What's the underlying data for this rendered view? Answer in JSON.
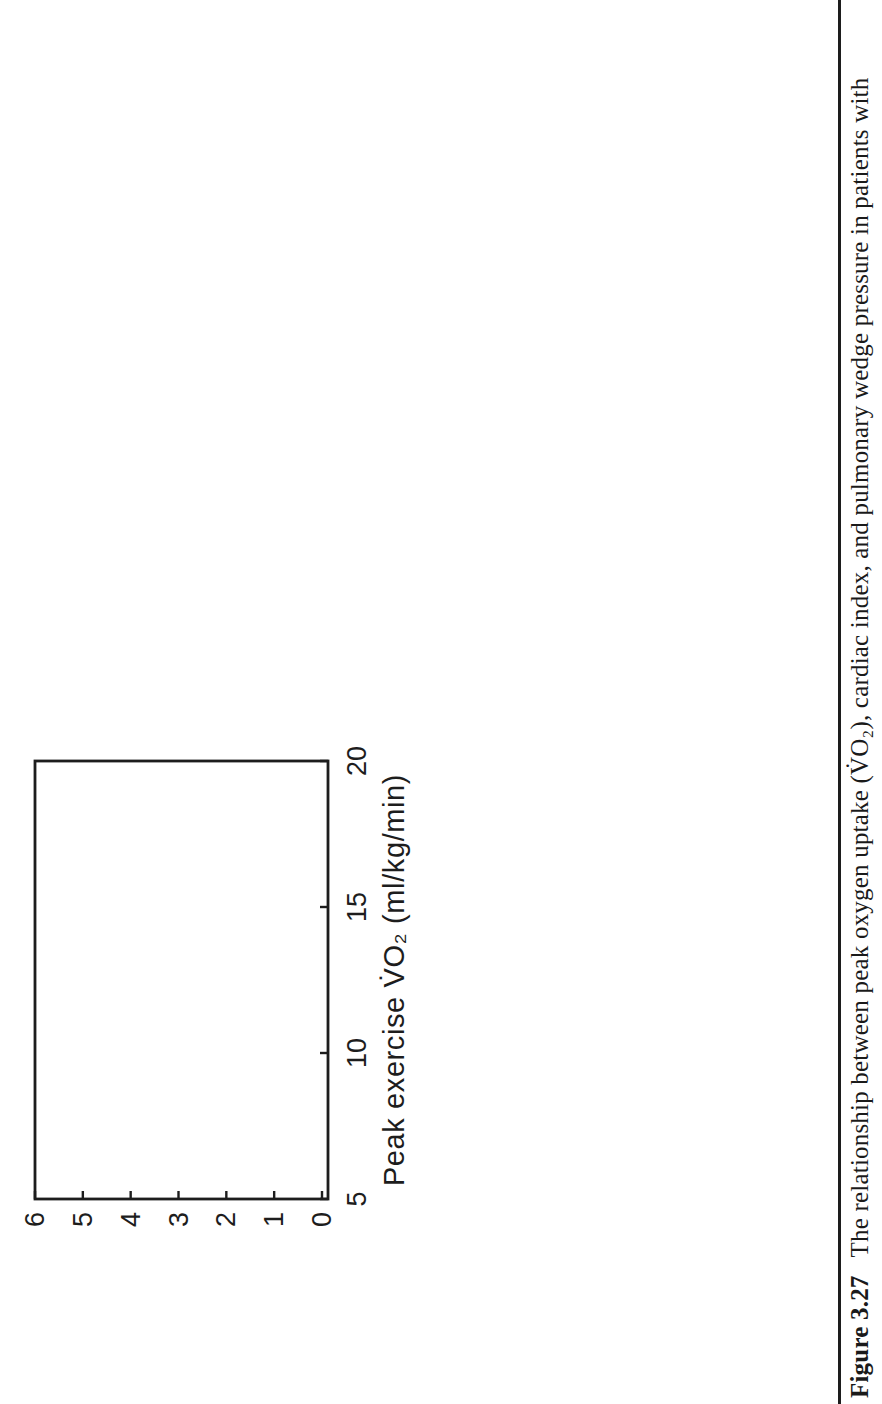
{
  "figure": {
    "caption_label": "Figure 3.27",
    "caption_text": "The relationship between peak oxygen uptake (V̇O₂), cardiac index, and pulmonary wedge pressure in patients with",
    "ink_color": "#1d1d1d",
    "paper_color": "#ffffff"
  },
  "chart_data": [
    {
      "id": "ci3",
      "type": "scatter",
      "position": "top-left",
      "xlabel": "Peak exercise V̇O₂ (ml/kg/min)",
      "ylabel_lines": [
        "Cardiac index at 3 min (L/min/m²)"
      ],
      "xlim": [
        5,
        20
      ],
      "ylim": [
        0,
        6
      ],
      "xticks": [
        5,
        10,
        15,
        20
      ],
      "yticks": [
        0,
        1,
        2,
        3,
        4,
        5,
        6
      ],
      "annotation": "p=NS",
      "points": [
        [
          19.8,
          3.4
        ],
        [
          17.9,
          5.3
        ],
        [
          18.0,
          3.3
        ],
        [
          18.1,
          2.8
        ],
        [
          17.7,
          3.7
        ],
        [
          17.5,
          4.0
        ],
        [
          17.4,
          3.9
        ],
        [
          17.2,
          3.95
        ],
        [
          17.1,
          3.85
        ],
        [
          17.2,
          3.4
        ],
        [
          17.1,
          3.2
        ],
        [
          17.0,
          3.1
        ],
        [
          16.9,
          3.0
        ],
        [
          16.6,
          4.75
        ],
        [
          16.8,
          1.9
        ],
        [
          16.4,
          2.9
        ],
        [
          15.9,
          3.0
        ],
        [
          15.8,
          3.6
        ],
        [
          15.9,
          3.5
        ],
        [
          15.5,
          3.7
        ],
        [
          15.5,
          3.55
        ],
        [
          15.5,
          3.4
        ],
        [
          15.4,
          3.3
        ],
        [
          15.0,
          3.2
        ],
        [
          14.7,
          3.3
        ],
        [
          14.5,
          3.2
        ],
        [
          14.3,
          3.25
        ],
        [
          14.6,
          3.9
        ],
        [
          14.2,
          4.7
        ],
        [
          15.2,
          2.3
        ],
        [
          14.9,
          2.7
        ],
        [
          14.5,
          2.4
        ],
        [
          14.7,
          2.2
        ],
        [
          14.2,
          2.6
        ],
        [
          14.1,
          2.1
        ],
        [
          13.4,
          4.0
        ],
        [
          13.5,
          3.2
        ],
        [
          13.6,
          3.1
        ],
        [
          13.2,
          3.0
        ],
        [
          13.3,
          2.8
        ],
        [
          13.0,
          2.7
        ],
        [
          13.3,
          2.65
        ],
        [
          12.9,
          5.6
        ],
        [
          12.9,
          1.9
        ],
        [
          12.6,
          2.9
        ],
        [
          12.7,
          2.8
        ],
        [
          12.7,
          2.2
        ],
        [
          12.5,
          2.2
        ],
        [
          12.2,
          2.1
        ],
        [
          12.1,
          4.7
        ],
        [
          12.1,
          4.5
        ],
        [
          11.8,
          4.7
        ],
        [
          11.8,
          4.5
        ],
        [
          12.1,
          3.4
        ],
        [
          12.3,
          3.2
        ],
        [
          12.2,
          3.1
        ],
        [
          12.1,
          2.6
        ],
        [
          12.2,
          2.45
        ],
        [
          12.6,
          2.3
        ],
        [
          11.4,
          4.5
        ],
        [
          11.3,
          4.2
        ],
        [
          11.6,
          3.1
        ],
        [
          11.5,
          2.2
        ],
        [
          10.7,
          4.0
        ],
        [
          10.1,
          3.7
        ],
        [
          9.8,
          3.7
        ],
        [
          9.8,
          4.2
        ],
        [
          10.0,
          3.0
        ],
        [
          9.6,
          2.8
        ],
        [
          10.8,
          2.4
        ],
        [
          9.6,
          1.9
        ]
      ]
    },
    {
      "id": "pw3",
      "type": "scatter",
      "position": "top-right",
      "xlabel": "Peak exercise V̇O₂ (ml/kg/min)",
      "ylabel_lines": [
        "Pulmonary wedge pressure",
        "at 3 min (mmHg)"
      ],
      "xlim": [
        5,
        20
      ],
      "ylim": [
        0,
        45
      ],
      "xticks": [
        5,
        10,
        15,
        20
      ],
      "yticks": [
        0,
        15,
        30,
        45
      ],
      "annotation": "p=NS",
      "points": [
        [
          19.7,
          6
        ],
        [
          17.9,
          23
        ],
        [
          17.8,
          16
        ],
        [
          17.5,
          14
        ],
        [
          17.0,
          14
        ],
        [
          17.3,
          5
        ],
        [
          16.8,
          21
        ],
        [
          16.9,
          19
        ],
        [
          16.5,
          28
        ],
        [
          16.6,
          5
        ],
        [
          16.5,
          6.5
        ],
        [
          16.0,
          26
        ],
        [
          16.1,
          9
        ],
        [
          15.4,
          29
        ],
        [
          15.5,
          22
        ],
        [
          15.4,
          21
        ],
        [
          15.1,
          26
        ],
        [
          14.9,
          24
        ],
        [
          15.0,
          24
        ],
        [
          15.0,
          20
        ],
        [
          15.2,
          15
        ],
        [
          14.6,
          38
        ],
        [
          14.4,
          26
        ],
        [
          14.4,
          3.5
        ],
        [
          13.8,
          2
        ],
        [
          13.8,
          26
        ],
        [
          13.5,
          24
        ],
        [
          13.4,
          22
        ],
        [
          13.5,
          18
        ],
        [
          13.9,
          11
        ],
        [
          13.6,
          7.5
        ],
        [
          13.5,
          33
        ],
        [
          13.5,
          32
        ],
        [
          13.2,
          33
        ],
        [
          12.8,
          21
        ],
        [
          12.7,
          20
        ],
        [
          12.5,
          21
        ],
        [
          12.8,
          12.5
        ],
        [
          13.0,
          11.5
        ],
        [
          12.3,
          34
        ],
        [
          12.3,
          32
        ],
        [
          12.2,
          26
        ],
        [
          11.8,
          27
        ],
        [
          12.0,
          26
        ],
        [
          12.0,
          11
        ],
        [
          11.7,
          11
        ],
        [
          11.6,
          36
        ],
        [
          11.5,
          29
        ],
        [
          11.3,
          25
        ],
        [
          11.5,
          19
        ],
        [
          11.3,
          19
        ],
        [
          11.2,
          15
        ],
        [
          11.0,
          42
        ],
        [
          10.6,
          30
        ],
        [
          10.6,
          24
        ],
        [
          10.4,
          16
        ],
        [
          10.3,
          5
        ],
        [
          9.9,
          29
        ],
        [
          9.6,
          15
        ],
        [
          8.6,
          38
        ],
        [
          8.4,
          28
        ],
        [
          8.8,
          25
        ],
        [
          8.4,
          16
        ],
        [
          8.5,
          11
        ],
        [
          9.0,
          9.5
        ]
      ]
    },
    {
      "id": "ci6",
      "type": "scatter",
      "position": "bottom-left",
      "xlabel": "Peak exercise V̇O₂ (ml/kg/min)",
      "ylabel_lines": [
        "Cardiac index at 6 min (L/min/m²)"
      ],
      "xlim": [
        5,
        20
      ],
      "ylim": [
        0,
        9
      ],
      "xticks": [
        5,
        10,
        15,
        20
      ],
      "yticks": [
        0,
        1,
        2,
        3,
        4,
        5,
        6,
        7,
        8,
        9
      ],
      "annotation": "p=NS",
      "points": [
        [
          19.7,
          4.3
        ],
        [
          17.8,
          8.2
        ],
        [
          17.9,
          4.4
        ],
        [
          18.0,
          3.5
        ],
        [
          17.3,
          5.7
        ],
        [
          17.5,
          4.2
        ],
        [
          17.2,
          4.5
        ],
        [
          17.0,
          4.2
        ],
        [
          16.9,
          4.1
        ],
        [
          17.1,
          3.7
        ],
        [
          16.8,
          1.8
        ],
        [
          16.4,
          4.9
        ],
        [
          16.3,
          3.4
        ],
        [
          15.8,
          4.7
        ],
        [
          15.5,
          4.6
        ],
        [
          15.8,
          3.9
        ],
        [
          15.5,
          3.8
        ],
        [
          15.4,
          4.2
        ],
        [
          15.2,
          4.1
        ],
        [
          15.7,
          3.1
        ],
        [
          14.8,
          3.8
        ],
        [
          14.9,
          3.6
        ],
        [
          15.0,
          3.0
        ],
        [
          14.5,
          4.5
        ],
        [
          14.4,
          4.15
        ],
        [
          14.45,
          3.95
        ],
        [
          14.5,
          3.75
        ],
        [
          14.1,
          5.0
        ],
        [
          14.1,
          3.0
        ],
        [
          14.0,
          2.7
        ],
        [
          13.9,
          4.1
        ],
        [
          13.8,
          4.0
        ],
        [
          13.5,
          3.9
        ],
        [
          13.7,
          2.9
        ],
        [
          13.4,
          2.8
        ],
        [
          13.3,
          2.7
        ],
        [
          13.2,
          4.7
        ],
        [
          13.0,
          3.5
        ],
        [
          12.7,
          5.3
        ],
        [
          12.7,
          3.1
        ],
        [
          12.4,
          3.1
        ],
        [
          12.9,
          2.1
        ],
        [
          12.7,
          2.3
        ],
        [
          12.75,
          2.5
        ],
        [
          12.5,
          3.4
        ],
        [
          12.2,
          3.2
        ],
        [
          12.2,
          3.0
        ],
        [
          12.1,
          3.6
        ],
        [
          11.8,
          3.5
        ],
        [
          12.0,
          5.0
        ],
        [
          11.8,
          4.2
        ],
        [
          11.7,
          3.8
        ],
        [
          11.4,
          4.25
        ],
        [
          11.3,
          4.15
        ],
        [
          11.3,
          3.4
        ],
        [
          11.3,
          2.5
        ],
        [
          10.6,
          2.8
        ],
        [
          10.4,
          3.6
        ],
        [
          10.0,
          4.2
        ],
        [
          9.6,
          4.1
        ],
        [
          9.8,
          3.2
        ],
        [
          9.4,
          3.1
        ],
        [
          9.4,
          2.2
        ]
      ]
    },
    {
      "id": "pw6",
      "type": "scatter",
      "position": "bottom-right",
      "xlabel": "Peak exercise V̇O₂ (ml/kg/min)",
      "ylabel_lines": [
        "Pulmonary wedge pressure",
        "at 6 min (mmHg)"
      ],
      "xlim": [
        5,
        20
      ],
      "ylim": [
        0,
        50
      ],
      "xticks": [
        5,
        10,
        15,
        20
      ],
      "yticks": [
        0,
        10,
        20,
        30,
        40,
        50
      ],
      "annotation": "p=NS",
      "points": [
        [
          19.6,
          13
        ],
        [
          17.9,
          28
        ],
        [
          17.6,
          25
        ],
        [
          17.5,
          16
        ],
        [
          16.8,
          29
        ],
        [
          17.0,
          21
        ],
        [
          16.9,
          19
        ],
        [
          16.5,
          24
        ],
        [
          17.2,
          8.5
        ],
        [
          16.5,
          11
        ],
        [
          16.7,
          10
        ],
        [
          16.0,
          12
        ],
        [
          16.0,
          34
        ],
        [
          15.4,
          27
        ],
        [
          15.4,
          24
        ],
        [
          15.5,
          23
        ],
        [
          15.0,
          25
        ],
        [
          15.0,
          22
        ],
        [
          15.2,
          19
        ],
        [
          14.7,
          27
        ],
        [
          14.6,
          38
        ],
        [
          14.4,
          27
        ],
        [
          14.4,
          4.5
        ],
        [
          13.8,
          35
        ],
        [
          13.9,
          16
        ],
        [
          13.4,
          16
        ],
        [
          13.9,
          9.5
        ],
        [
          13.6,
          7
        ],
        [
          13.5,
          29
        ],
        [
          13.4,
          28.5
        ],
        [
          13.1,
          29
        ],
        [
          13.4,
          27.5
        ],
        [
          13.5,
          24
        ],
        [
          13.1,
          24
        ],
        [
          12.9,
          23
        ],
        [
          12.7,
          22
        ],
        [
          12.6,
          10
        ],
        [
          12.4,
          34
        ],
        [
          12.4,
          29
        ],
        [
          12.1,
          28
        ],
        [
          12.5,
          26
        ],
        [
          12.1,
          25
        ],
        [
          11.3,
          25
        ],
        [
          11.9,
          20
        ],
        [
          12.1,
          14
        ],
        [
          11.6,
          37
        ],
        [
          11.1,
          36.5
        ],
        [
          11.7,
          29
        ],
        [
          11.5,
          24
        ],
        [
          11.2,
          17
        ],
        [
          10.6,
          34
        ],
        [
          10.4,
          29
        ],
        [
          10.6,
          28
        ],
        [
          10.3,
          5.5
        ],
        [
          9.8,
          34
        ],
        [
          9.6,
          23
        ],
        [
          8.9,
          34
        ],
        [
          8.4,
          26
        ],
        [
          8.4,
          16
        ],
        [
          8.5,
          12
        ]
      ]
    }
  ]
}
